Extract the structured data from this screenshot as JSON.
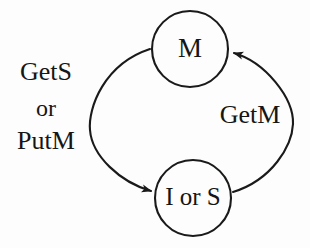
{
  "diagram": {
    "type": "state-transition-diagram",
    "background_color": "#fdfdfd",
    "stroke_color": "#1a1a1a",
    "text_color": "#151515",
    "nodes": [
      {
        "id": "m",
        "label": "M",
        "cx": 190,
        "cy": 49,
        "r": 38
      },
      {
        "id": "ios",
        "label": "I or S",
        "cx": 193,
        "cy": 198,
        "r": 38
      }
    ],
    "edges": [
      {
        "id": "m-to-ios",
        "from": "m",
        "to": "ios",
        "side": "left",
        "label_lines": [
          "GetS",
          "or",
          "PutM"
        ],
        "path": "M150,49 C104,64 88,108 90,130 C92,156 120,182 151,191",
        "arrow_tip_x": 157,
        "arrow_tip_y": 192
      },
      {
        "id": "ios-to-m",
        "from": "ios",
        "to": "m",
        "side": "right",
        "label_lines": [
          "GetM"
        ],
        "path": "M233,192 C272,180 292,146 293,124 C294,98 265,62 234,53",
        "arrow_tip_x": 227,
        "arrow_tip_y": 51
      }
    ],
    "labels": {
      "left_line1": "GetS",
      "left_line2": "or",
      "left_line3": "PutM",
      "right_line1": "GetM"
    },
    "label_positions": {
      "left_line1": {
        "x": 46,
        "y": 74
      },
      "left_line2": {
        "x": 46,
        "y": 110
      },
      "left_line3": {
        "x": 46,
        "y": 143
      },
      "right_line1": {
        "x": 250,
        "y": 117
      }
    }
  }
}
